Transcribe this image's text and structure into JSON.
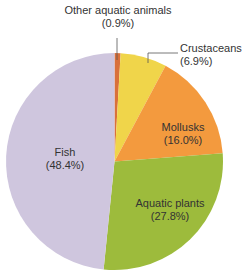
{
  "chart_data": {
    "type": "pie",
    "title": "",
    "start_angle_deg": 0,
    "direction": "clockwise",
    "slices": [
      {
        "name": "Other aquatic animals",
        "value": 0.9,
        "label": "(0.9%)",
        "color": "#d9703a"
      },
      {
        "name": "Crustaceans",
        "value": 6.9,
        "label": "(6.9%)",
        "color": "#f0d54a"
      },
      {
        "name": "Mollusks",
        "value": 16.0,
        "label": "(16.0%)",
        "color": "#f39a3e"
      },
      {
        "name": "Aquatic plants",
        "value": 27.8,
        "label": "(27.8%)",
        "color": "#9dbb3c"
      },
      {
        "name": "Fish",
        "value": 48.4,
        "label": "(48.4%)",
        "color": "#cfc6de"
      }
    ],
    "categories": [
      "Other aquatic animals",
      "Crustaceans",
      "Mollusks",
      "Aquatic plants",
      "Fish"
    ],
    "values": [
      0.9,
      6.9,
      16.0,
      27.8,
      48.4
    ],
    "legend": "none (direct labels)"
  },
  "labels": {
    "other": {
      "name": "Other aquatic animals",
      "pct": "(0.9%)"
    },
    "crustaceans": {
      "name": "Crustaceans",
      "pct": "(6.9%)"
    },
    "mollusks": {
      "name": "Mollusks",
      "pct": "(16.0%)"
    },
    "plants": {
      "name": "Aquatic plants",
      "pct": "(27.8%)"
    },
    "fish": {
      "name": "Fish",
      "pct": "(48.4%)"
    }
  }
}
